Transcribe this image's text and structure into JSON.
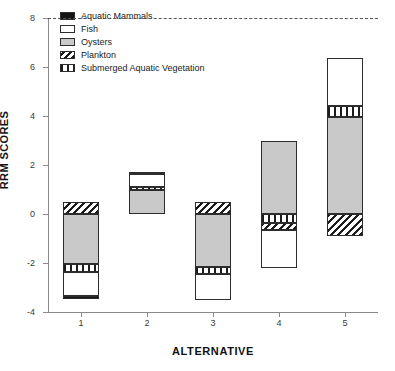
{
  "chart_data": {
    "type": "bar",
    "subtype": "stacked-bar-diverging",
    "title": "",
    "xlabel": "ALTERNATIVE",
    "ylabel": "RRM SCORES",
    "categories": [
      "1",
      "2",
      "3",
      "4",
      "5"
    ],
    "ylim": [
      -4,
      8
    ],
    "yticks": [
      8,
      6,
      4,
      2,
      0,
      -2,
      -4
    ],
    "ytick_labels": [
      "8",
      "6",
      "4",
      "2",
      "0",
      "-2",
      "-4"
    ],
    "xtick_labels": [
      "1",
      "2",
      "3",
      "4",
      "5"
    ],
    "grid": false,
    "zero_line": true,
    "legend_position": "top-left",
    "series": [
      {
        "name": "Aquatic Mammals",
        "fill": "black",
        "values": [
          -0.12,
          0.08,
          0.0,
          0.0,
          0.0
        ]
      },
      {
        "name": "Fish",
        "fill": "white",
        "values": [
          -1.0,
          0.55,
          -1.1,
          -1.55,
          1.95
        ]
      },
      {
        "name": "Oysters",
        "fill": "gray",
        "values": [
          -2.05,
          0.98,
          -2.15,
          3.0,
          3.95
        ]
      },
      {
        "name": "Plankton",
        "fill": "hatch",
        "values": [
          0.47,
          0.0,
          0.5,
          -0.3,
          -0.9
        ]
      },
      {
        "name": "Submerged Aquatic Vegetation",
        "fill": "vertical-stripe",
        "values": [
          -0.3,
          0.12,
          -0.28,
          -0.35,
          0.45
        ]
      }
    ],
    "bars": [
      {
        "category": "1",
        "positive_total": 0.47,
        "negative_total": -3.47,
        "segments": [
          {
            "name": "Plankton",
            "fill": "hatch",
            "from": 0.0,
            "to": 0.47
          },
          {
            "name": "Oysters",
            "fill": "gray",
            "from": 0.0,
            "to": -2.05
          },
          {
            "name": "Submerged Aquatic Vegetation",
            "fill": "vertical-stripe",
            "from": -2.05,
            "to": -2.35
          },
          {
            "name": "Fish",
            "fill": "white",
            "from": -2.35,
            "to": -3.35
          },
          {
            "name": "Aquatic Mammals",
            "fill": "black",
            "from": -3.35,
            "to": -3.47
          }
        ]
      },
      {
        "category": "2",
        "positive_total": 1.73,
        "negative_total": 0.0,
        "segments": [
          {
            "name": "Oysters",
            "fill": "gray",
            "from": 0.0,
            "to": 0.98
          },
          {
            "name": "Submerged Aquatic Vegetation",
            "fill": "vertical-stripe",
            "from": 0.98,
            "to": 1.1
          },
          {
            "name": "Fish",
            "fill": "white",
            "from": 1.1,
            "to": 1.65
          },
          {
            "name": "Aquatic Mammals",
            "fill": "black",
            "from": 1.65,
            "to": 1.73
          }
        ]
      },
      {
        "category": "3",
        "positive_total": 0.5,
        "negative_total": -3.53,
        "segments": [
          {
            "name": "Plankton",
            "fill": "hatch",
            "from": 0.0,
            "to": 0.5
          },
          {
            "name": "Oysters",
            "fill": "gray",
            "from": 0.0,
            "to": -2.15
          },
          {
            "name": "Submerged Aquatic Vegetation",
            "fill": "vertical-stripe",
            "from": -2.15,
            "to": -2.43
          },
          {
            "name": "Fish",
            "fill": "white",
            "from": -2.43,
            "to": -3.53
          }
        ]
      },
      {
        "category": "4",
        "positive_total": 3.0,
        "negative_total": -2.2,
        "segments": [
          {
            "name": "Oysters",
            "fill": "gray",
            "from": 0.0,
            "to": 3.0
          },
          {
            "name": "Submerged Aquatic Vegetation",
            "fill": "vertical-stripe",
            "from": 0.0,
            "to": -0.35
          },
          {
            "name": "Plankton",
            "fill": "hatch",
            "from": -0.35,
            "to": -0.65
          },
          {
            "name": "Fish",
            "fill": "white",
            "from": -0.65,
            "to": -2.2
          }
        ]
      },
      {
        "category": "5",
        "positive_total": 6.35,
        "negative_total": -0.9,
        "segments": [
          {
            "name": "Oysters",
            "fill": "gray",
            "from": 0.0,
            "to": 3.95
          },
          {
            "name": "Submerged Aquatic Vegetation",
            "fill": "vertical-stripe",
            "from": 3.95,
            "to": 4.4
          },
          {
            "name": "Fish",
            "fill": "white",
            "from": 4.4,
            "to": 6.35
          },
          {
            "name": "Plankton",
            "fill": "hatch",
            "from": 0.0,
            "to": -0.9
          }
        ]
      }
    ],
    "legend": [
      {
        "label": "Aquatic Mammals",
        "fill": "black"
      },
      {
        "label": "Fish",
        "fill": "white"
      },
      {
        "label": "Oysters",
        "fill": "gray"
      },
      {
        "label": "Plankton",
        "fill": "hatch"
      },
      {
        "label": "Submerged Aquatic Vegetation",
        "fill": "vertical-stripe"
      }
    ],
    "colors": {
      "black": "#141414",
      "white": "#ffffff",
      "gray": "#c9c9c9",
      "outline": "#2d2d2d",
      "axis": "#8a8a8a",
      "text": "#1a1a1a"
    }
  }
}
